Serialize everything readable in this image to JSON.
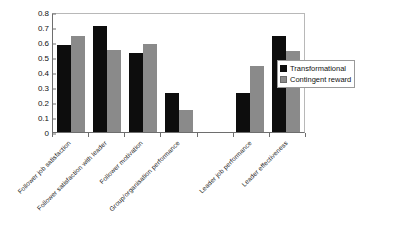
{
  "chart_data": {
    "type": "bar",
    "title": "",
    "subtitle": "",
    "xlabel": "",
    "ylabel": "",
    "ylim": [
      0,
      0.8
    ],
    "ytick_labels": [
      "0",
      "0.1",
      "0.2",
      "0.3",
      "0.4",
      "0.5",
      "0.6",
      "0.7",
      "0.8"
    ],
    "ytick_values": [
      0,
      0.1,
      0.2,
      0.3,
      0.4,
      0.5,
      0.6,
      0.7,
      0.8
    ],
    "grid": false,
    "legend_position": "right",
    "categories": [
      "Follower job satisfaction",
      "Follower satisfaction with leader",
      "Follower motivation",
      "Group/organisation performance",
      "",
      "Leader job performance",
      "Leader effectiveness"
    ],
    "series": [
      {
        "name": "Transformational",
        "color": "#0d0d0d",
        "values": [
          0.58,
          0.71,
          0.53,
          0.26,
          null,
          0.26,
          0.64
        ]
      },
      {
        "name": "Contingent reward",
        "color": "#8a8a8a",
        "values": [
          0.64,
          0.55,
          0.59,
          0.15,
          null,
          0.44,
          0.54
        ]
      }
    ]
  },
  "legend": {
    "items": [
      {
        "label": "Transformational",
        "swatch": "black-square-icon"
      },
      {
        "label": "Contingent reward",
        "swatch": "gray-square-icon"
      }
    ]
  }
}
